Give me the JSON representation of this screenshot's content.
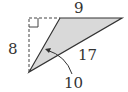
{
  "diagram": {
    "type": "triangle",
    "fill_color": "#d8d8d8",
    "stroke_color": "#333333",
    "labels": {
      "top": "9",
      "left": "8",
      "hypotenuse": "17",
      "bottom": "10"
    },
    "right_angle_marker": true
  }
}
